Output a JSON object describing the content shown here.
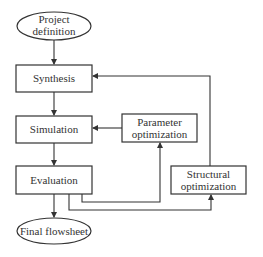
{
  "diagram": {
    "type": "flowchart",
    "colors": {
      "stroke": "#333333",
      "text": "#333333",
      "background": "#ffffff"
    },
    "nodes": {
      "project_definition": {
        "shape": "ellipse",
        "lines": [
          "Project",
          "definition"
        ]
      },
      "synthesis": {
        "shape": "rect",
        "lines": [
          "Synthesis"
        ]
      },
      "simulation": {
        "shape": "rect",
        "lines": [
          "Simulation"
        ]
      },
      "evaluation": {
        "shape": "rect",
        "lines": [
          "Evaluation"
        ]
      },
      "final_flowsheet": {
        "shape": "ellipse",
        "lines": [
          "Final flowsheet"
        ]
      },
      "parameter_optimization": {
        "shape": "rect",
        "lines": [
          "Parameter",
          "optimization"
        ]
      },
      "structural_optimization": {
        "shape": "rect",
        "lines": [
          "Structural",
          "optimization"
        ]
      }
    },
    "edges": [
      {
        "from": "Project definition",
        "to": "Synthesis"
      },
      {
        "from": "Synthesis",
        "to": "Simulation"
      },
      {
        "from": "Simulation",
        "to": "Evaluation"
      },
      {
        "from": "Evaluation",
        "to": "Final flowsheet"
      },
      {
        "from": "Evaluation",
        "to": "Parameter optimization"
      },
      {
        "from": "Evaluation",
        "to": "Structural optimization"
      },
      {
        "from": "Parameter optimization",
        "to": "Simulation"
      },
      {
        "from": "Structural optimization",
        "to": "Synthesis"
      }
    ]
  }
}
